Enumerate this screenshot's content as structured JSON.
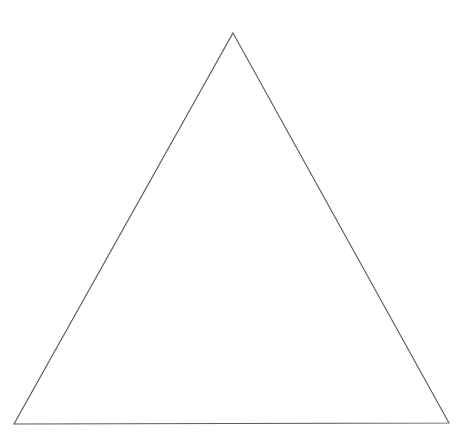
{
  "canvas": {
    "width": 475,
    "height": 440,
    "background_color": "#ffffff",
    "description": "Line drawing of a single hollow triangle"
  },
  "figure": {
    "name": "triangle",
    "shape_type": "triangle",
    "filled": false,
    "fill_color": "none",
    "stroke_color": "#5a5a5a",
    "stroke_width": 1.1,
    "vertex_count": 3,
    "orientation": "apex-up",
    "classification": "isosceles",
    "vertices": [
      {
        "label": "apex",
        "x": 233,
        "y": 33
      },
      {
        "label": "bottom-right",
        "x": 449,
        "y": 423
      },
      {
        "label": "bottom-left",
        "x": 14,
        "y": 424
      }
    ],
    "points_attr": "233,33 449,423 14,424",
    "edges": [
      {
        "name": "left-edge",
        "from": "apex",
        "to": "bottom-left"
      },
      {
        "name": "right-edge",
        "from": "apex",
        "to": "bottom-right"
      },
      {
        "name": "base-edge",
        "from": "bottom-left",
        "to": "bottom-right"
      }
    ],
    "metrics": {
      "base_width": 435,
      "height": 391,
      "apex_offset_from_base_center": 1.5
    }
  }
}
